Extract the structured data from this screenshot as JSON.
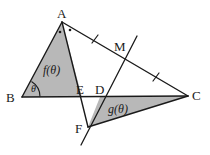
{
  "figure": {
    "type": "geometry-diagram",
    "width": 210,
    "height": 155,
    "background_color": "#ffffff",
    "stroke_color": "#1a1a1a",
    "shaded_fill_color": "#b8b8b8",
    "vertices": [
      {
        "name": "A",
        "label": "A",
        "x": 62,
        "y": 22,
        "label_x": 57,
        "label_y": 7
      },
      {
        "name": "B",
        "label": "B",
        "x": 22,
        "y": 97,
        "label_x": 6,
        "label_y": 91
      },
      {
        "name": "C",
        "label": "C",
        "x": 188,
        "y": 96,
        "label_x": 192,
        "label_y": 89
      },
      {
        "name": "D",
        "label": "D",
        "x": 100,
        "y": 97,
        "label_x": 95,
        "label_y": 83
      },
      {
        "name": "E",
        "label": "E",
        "x": 82,
        "y": 97,
        "label_x": 76,
        "label_y": 83
      },
      {
        "name": "F",
        "label": "F",
        "x": 88,
        "y": 127,
        "label_x": 75,
        "label_y": 122
      },
      {
        "name": "M",
        "label": "M",
        "x": 127,
        "y": 55,
        "label_x": 114,
        "label_y": 40
      }
    ],
    "region_labels": [
      {
        "name": "f-theta",
        "text": "f(θ)",
        "x": 43,
        "y": 64
      },
      {
        "name": "g-theta",
        "text": "g(θ)",
        "x": 108,
        "y": 103
      }
    ],
    "angle_labels": [
      {
        "name": "theta-at-B",
        "text": "θ",
        "x": 31,
        "y": 84
      }
    ],
    "segments": [
      {
        "name": "segment-AB",
        "from": "A",
        "to": "B"
      },
      {
        "name": "segment-BC",
        "from": "B",
        "to": "C"
      },
      {
        "name": "segment-AC",
        "from": "A",
        "to": "C"
      },
      {
        "name": "segment-AF",
        "from": "A",
        "to": "F"
      },
      {
        "name": "segment-FC",
        "from": "F",
        "to": "C"
      },
      {
        "name": "line-through-F-D-M",
        "from": "F",
        "to": "M"
      }
    ],
    "tick_marks": [
      {
        "name": "tick-AM",
        "x": 95,
        "y": 39
      },
      {
        "name": "tick-MC",
        "x": 156,
        "y": 77
      }
    ],
    "angle_dots": [
      {
        "name": "angle-dot-left",
        "x": 60,
        "y": 32
      },
      {
        "name": "angle-dot-right",
        "x": 70,
        "y": 30
      }
    ],
    "shaded_regions": [
      {
        "name": "shaded-triangle-ABE",
        "points": "62,22 22,97 82,97"
      },
      {
        "name": "shaded-triangle-DFC",
        "points": "100,97 88,127 188,96"
      }
    ]
  }
}
